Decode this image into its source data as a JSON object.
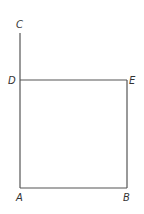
{
  "diagram": {
    "title": "",
    "points": [
      {
        "id": "C",
        "label": "C",
        "x": 20,
        "y": 33,
        "lx": 17,
        "ly": 27
      },
      {
        "id": "D",
        "label": "D",
        "x": 20,
        "y": 80,
        "lx": 8,
        "ly": 84
      },
      {
        "id": "E",
        "label": "E",
        "x": 127,
        "y": 80,
        "lx": 130,
        "ly": 84
      },
      {
        "id": "A",
        "label": "A",
        "x": 20,
        "y": 188,
        "lx": 16,
        "ly": 201
      },
      {
        "id": "B",
        "label": "B",
        "x": 127,
        "y": 188,
        "lx": 123,
        "ly": 201
      }
    ],
    "segments": [
      {
        "from": "C",
        "to": "A"
      },
      {
        "from": "D",
        "to": "E"
      },
      {
        "from": "E",
        "to": "B"
      },
      {
        "from": "A",
        "to": "B"
      }
    ],
    "labels": {
      "C": "C",
      "D": "D",
      "E": "E",
      "A": "A",
      "B": "B"
    }
  }
}
